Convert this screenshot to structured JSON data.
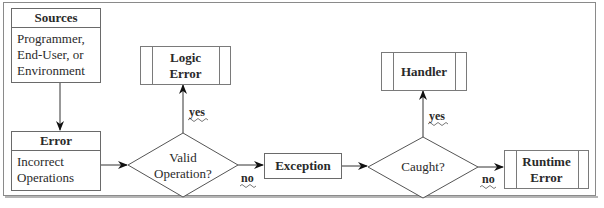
{
  "diagram": {
    "sources": {
      "title": "Sources",
      "lines": [
        "Programmer,",
        "End-User, or",
        "Environment"
      ]
    },
    "error": {
      "title": "Error",
      "lines": [
        "Incorrect",
        "Operations"
      ]
    },
    "valid_decision": {
      "lines": [
        "Valid",
        "Operation?"
      ]
    },
    "logic_error": {
      "lines": [
        "Logic",
        "Error"
      ]
    },
    "exception": {
      "label": "Exception"
    },
    "caught_decision": {
      "label": "Caught?"
    },
    "handler": {
      "label": "Handler"
    },
    "runtime_error": {
      "lines": [
        "Runtime",
        "Error"
      ]
    },
    "edge_labels": {
      "valid_yes": "yes",
      "valid_no": "no",
      "caught_yes": "yes",
      "caught_no": "no"
    }
  }
}
